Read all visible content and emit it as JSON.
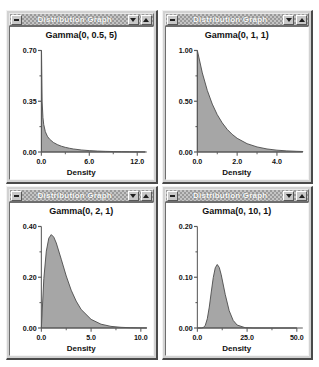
{
  "window_title": "Distribution Graph",
  "titlebar_buttons": {
    "system_menu": "system-menu",
    "minimize": "minimize",
    "maximize": "maximize"
  },
  "axis_label": "Density",
  "colors": {
    "curve_fill": "#a6a6a6",
    "curve_stroke": "#4d4d4d",
    "axis": "#5a5a5a",
    "titlebar": "#9a9a9a",
    "window_face": "#d2d2d2",
    "page_background": "#ffffff",
    "plot_background": "#ffffff"
  },
  "panels": [
    {
      "title": "Gamma(0, 0.5, 5)",
      "chart_data": {
        "type": "area",
        "title": "Gamma(0, 0.5, 5)",
        "xlabel": "Density",
        "ylabel": "",
        "grid": false,
        "legend": "none",
        "distribution": "gamma",
        "params": {
          "location": 0,
          "shape": 0.5,
          "scale": 5
        },
        "xlim": [
          0.0,
          13.2
        ],
        "ylim": [
          0.0,
          0.7
        ],
        "xticks": [
          "0.0",
          "6.0",
          "12.0"
        ],
        "xtick_values": [
          0.0,
          6.0,
          12.0
        ],
        "yticks": [
          "0.00",
          "0.35",
          "0.70"
        ],
        "ytick_values": [
          0.0,
          0.35,
          0.7
        ],
        "x": [
          0.02,
          0.1,
          0.2,
          0.3,
          0.5,
          0.75,
          1.0,
          1.5,
          2.0,
          2.5,
          3.0,
          3.5,
          4.0,
          5.0,
          6.0,
          7.0,
          8.0,
          9.0,
          10.0,
          11.0,
          12.0,
          13.0
        ],
        "y": [
          0.7,
          0.345,
          0.237,
          0.189,
          0.14,
          0.109,
          0.09,
          0.066,
          0.051,
          0.04,
          0.032,
          0.026,
          0.021,
          0.014,
          0.0095,
          0.0065,
          0.0045,
          0.0031,
          0.0021,
          0.0015,
          0.001,
          0.0007
        ]
      }
    },
    {
      "title": "Gamma(0, 1, 1)",
      "chart_data": {
        "type": "area",
        "title": "Gamma(0, 1, 1)",
        "xlabel": "Density",
        "ylabel": "",
        "grid": false,
        "legend": "none",
        "distribution": "gamma",
        "params": {
          "location": 0,
          "shape": 1,
          "scale": 1
        },
        "xlim": [
          0.0,
          5.3
        ],
        "ylim": [
          0.0,
          1.0
        ],
        "xticks": [
          "0.0",
          "2.0",
          "4.0"
        ],
        "xtick_values": [
          0.0,
          2.0,
          4.0
        ],
        "yticks": [
          "0.00",
          "0.50",
          "1.00"
        ],
        "ytick_values": [
          0.0,
          0.5,
          1.0
        ],
        "x": [
          0.0,
          0.25,
          0.5,
          0.75,
          1.0,
          1.25,
          1.5,
          1.75,
          2.0,
          2.5,
          3.0,
          3.5,
          4.0,
          4.5,
          5.0,
          5.3
        ],
        "y": [
          1.0,
          0.779,
          0.607,
          0.472,
          0.368,
          0.287,
          0.223,
          0.174,
          0.135,
          0.082,
          0.05,
          0.03,
          0.018,
          0.011,
          0.0067,
          0.005
        ]
      }
    },
    {
      "title": "Gamma(0, 2, 1)",
      "chart_data": {
        "type": "area",
        "title": "Gamma(0, 2, 1)",
        "xlabel": "Density",
        "ylabel": "",
        "grid": false,
        "legend": "none",
        "distribution": "gamma",
        "params": {
          "location": 0,
          "shape": 2,
          "scale": 1
        },
        "xlim": [
          0.0,
          10.6
        ],
        "ylim": [
          0.0,
          0.4
        ],
        "xticks": [
          "0.0",
          "5.0",
          "10.0"
        ],
        "xtick_values": [
          0.0,
          5.0,
          10.0
        ],
        "yticks": [
          "0.00",
          "0.20",
          "0.40"
        ],
        "ytick_values": [
          0.0,
          0.2,
          0.4
        ],
        "x": [
          0.0,
          0.25,
          0.5,
          0.75,
          1.0,
          1.25,
          1.5,
          2.0,
          2.5,
          3.0,
          3.5,
          4.0,
          5.0,
          6.0,
          7.0,
          8.0,
          9.0,
          10.0,
          10.6
        ],
        "y": [
          0.0,
          0.195,
          0.303,
          0.354,
          0.368,
          0.358,
          0.335,
          0.271,
          0.205,
          0.149,
          0.106,
          0.073,
          0.034,
          0.015,
          0.0064,
          0.0027,
          0.0011,
          0.00045,
          0.0003
        ]
      }
    },
    {
      "title": "Gamma(0, 10, 1)",
      "chart_data": {
        "type": "area",
        "title": "Gamma(0, 10, 1)",
        "xlabel": "Density",
        "ylabel": "",
        "grid": false,
        "legend": "none",
        "distribution": "gamma",
        "params": {
          "location": 0,
          "shape": 10,
          "scale": 1
        },
        "xlim": [
          0.0,
          53.0
        ],
        "ylim": [
          0.0,
          0.2
        ],
        "xticks": [
          "0.0",
          "25.0",
          "50.0"
        ],
        "xtick_values": [
          0.0,
          25.0,
          50.0
        ],
        "yticks": [
          "0.00",
          "0.10",
          "0.20"
        ],
        "ytick_values": [
          0.0,
          0.1,
          0.2
        ],
        "x": [
          0.0,
          2.0,
          3.0,
          4.0,
          5.0,
          6.0,
          7.0,
          8.0,
          9.0,
          10.0,
          11.0,
          12.0,
          14.0,
          16.0,
          18.0,
          20.0,
          24.0,
          28.0,
          34.0,
          40.0,
          50.0
        ],
        "y": [
          0.0,
          3.82e-05,
          0.00081,
          0.00529,
          0.0181,
          0.0413,
          0.071,
          0.0993,
          0.1186,
          0.1251,
          0.1194,
          0.1048,
          0.0663,
          0.0341,
          0.015,
          0.0058,
          0.00065,
          6.2e-05,
          1.2e-06,
          2e-08,
          0.0
        ]
      }
    }
  ]
}
